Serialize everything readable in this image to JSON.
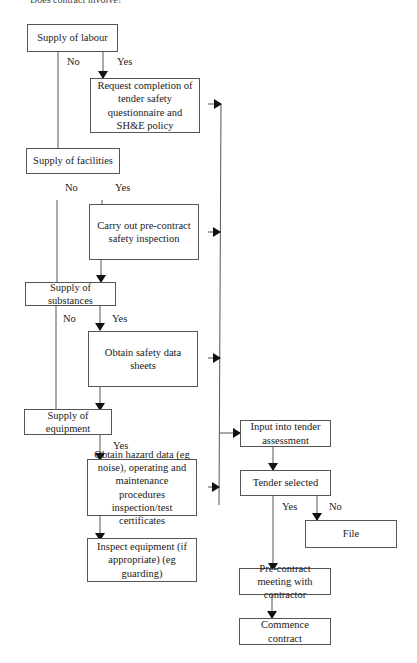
{
  "header": {
    "text": "Does contract involve?"
  },
  "nodes": {
    "labour": "Supply of labour",
    "questionnaire": "Request completion of tender safety questionnaire and SH&E policy",
    "facilities": "Supply of facilities",
    "inspection": "Carry out pre-contract safety inspection",
    "substances": "Supply of substances",
    "datasheets": "Obtain safety data sheets",
    "equipment": "Supply of equipment",
    "hazard": "Obtain hazard data (eg noise), operating and maintenance procedures inspection/test certificates",
    "inspect_equipment": "Inspect equipment (if appropriate) (eg guarding)",
    "tender_input": "Input into tender assessment",
    "tender_selected": "Tender selected",
    "file": "File",
    "meeting": "Pre-contract meeting with contractor",
    "commence": "Commence contract"
  },
  "labels": {
    "yes": "Yes",
    "no": "No"
  }
}
